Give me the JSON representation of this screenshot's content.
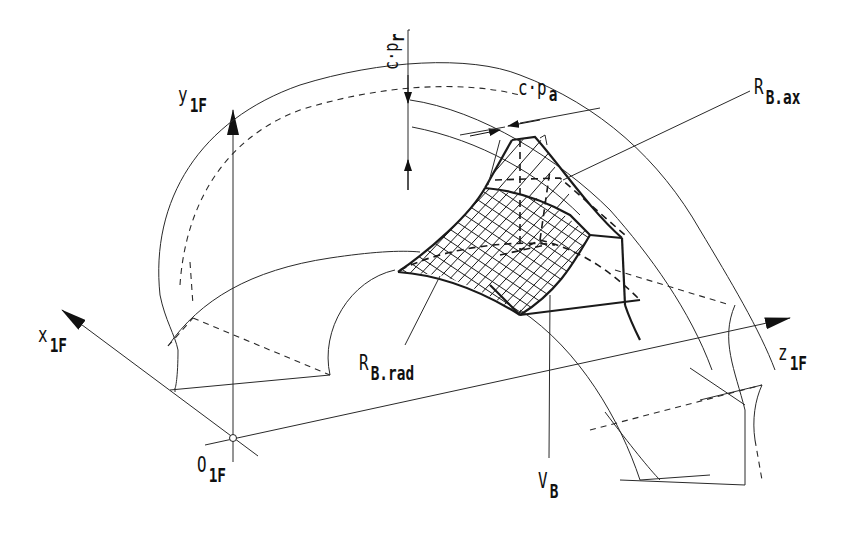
{
  "figure": {
    "stroke_color": "#1a1a1a",
    "background": "#ffffff"
  },
  "axes": {
    "x": {
      "label": "x",
      "subscript": "1F"
    },
    "y": {
      "label": "y",
      "subscript": "1F"
    },
    "z": {
      "label": "z",
      "subscript": "1F"
    },
    "origin": {
      "label": "O",
      "subscript": "1F"
    }
  },
  "labels": {
    "c_pr": "c·p",
    "c_pr_sub": "r",
    "c_pa": "c·p",
    "c_pa_sub": "a",
    "r_b_ax": "R",
    "r_b_ax_sub": "B.ax",
    "r_b_rad": "R",
    "r_b_rad_sub": "B.rad",
    "v_b": "V",
    "v_b_sub": "B"
  }
}
